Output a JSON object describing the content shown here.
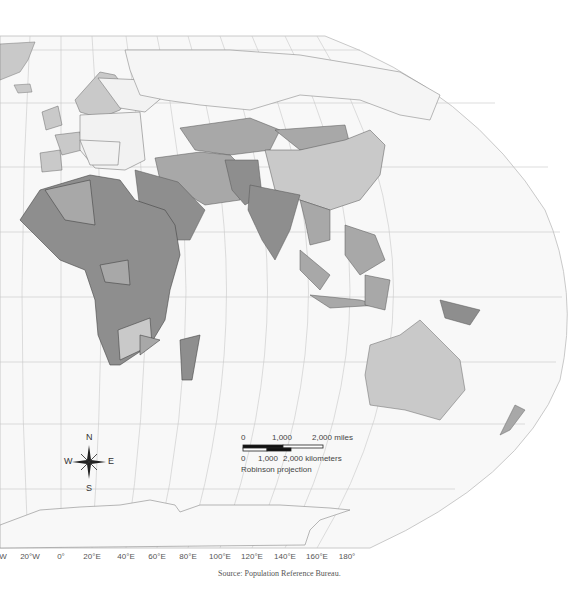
{
  "map": {
    "projection_label": "Robinson projection",
    "source": "Source: Population Reference Bureau.",
    "colors": {
      "background": "#ffffff",
      "ocean": "#f7f7f7",
      "graticule": "#c4c4c4",
      "border": "#555555",
      "class_dark": "#8e8e8e",
      "class_medium": "#a8a8a8",
      "class_light": "#c9c9c9",
      "class_none": "#f4f4f4"
    },
    "longitude_labels": [
      {
        "label": "W",
        "x": 3
      },
      {
        "label": "20°W",
        "x": 30
      },
      {
        "label": "0°",
        "x": 61
      },
      {
        "label": "20°E",
        "x": 92
      },
      {
        "label": "40°E",
        "x": 126
      },
      {
        "label": "60°E",
        "x": 157
      },
      {
        "label": "80°E",
        "x": 188
      },
      {
        "label": "100°E",
        "x": 220
      },
      {
        "label": "120°E",
        "x": 252
      },
      {
        "label": "140°E",
        "x": 285
      },
      {
        "label": "160°E",
        "x": 317
      },
      {
        "label": "180°",
        "x": 347
      }
    ],
    "compass": {
      "n": "N",
      "s": "S",
      "e": "E",
      "w": "W"
    },
    "scale_bar": {
      "miles_labels": [
        "0",
        "1,000",
        "2,000 miles"
      ],
      "km_labels": [
        "0",
        "1,000",
        "2,000 kilometers"
      ]
    }
  }
}
